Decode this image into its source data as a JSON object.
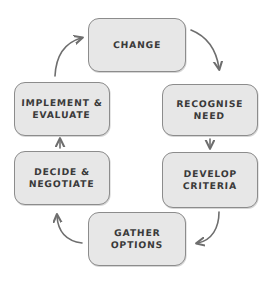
{
  "diagram": {
    "type": "cycle",
    "direction": "clockwise",
    "style": "hand-drawn sketch",
    "colors": {
      "node_fill": "#e7e7e7",
      "node_border": "#8c8c8c",
      "text": "#3a3a3a",
      "arrow": "#6e6e6e",
      "background": "#ffffff"
    },
    "nodes": [
      {
        "id": "change",
        "label": "CHANGE",
        "order": 1
      },
      {
        "id": "recognise",
        "label": "RECOGNISE\nNEED",
        "order": 2
      },
      {
        "id": "develop",
        "label": "DEVELOP\nCRITERIA",
        "order": 3
      },
      {
        "id": "gather",
        "label": "GATHER\nOPTIONS",
        "order": 4
      },
      {
        "id": "decide",
        "label": "DECIDE &\nNEGOTIATE",
        "order": 5
      },
      {
        "id": "implement",
        "label": "IMPLEMENT &\nEVALUATE",
        "order": 6
      }
    ],
    "arrows": [
      {
        "id": "change-to-recognise",
        "from": "change",
        "to": "recognise",
        "shape": "curve"
      },
      {
        "id": "recognise-to-develop",
        "from": "recognise",
        "to": "develop",
        "shape": "straight-down"
      },
      {
        "id": "develop-to-gather",
        "from": "develop",
        "to": "gather",
        "shape": "curve"
      },
      {
        "id": "gather-to-decide",
        "from": "gather",
        "to": "decide",
        "shape": "curve"
      },
      {
        "id": "decide-to-implement",
        "from": "decide",
        "to": "implement",
        "shape": "straight-up"
      },
      {
        "id": "implement-to-change",
        "from": "implement",
        "to": "change",
        "shape": "curve"
      }
    ]
  }
}
